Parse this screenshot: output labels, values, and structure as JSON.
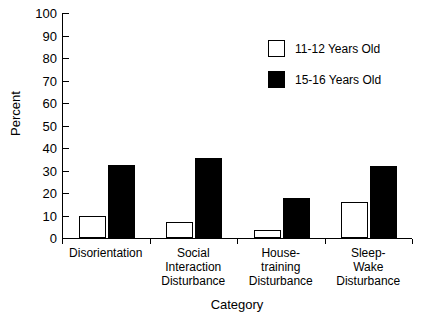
{
  "chart_data": {
    "type": "bar",
    "title": "",
    "xlabel": "Category",
    "ylabel": "Percent",
    "ylim": [
      0,
      100
    ],
    "yticks": [
      0,
      10,
      20,
      30,
      40,
      50,
      60,
      70,
      80,
      90,
      100
    ],
    "ytick_labels": [
      "0",
      "10",
      "20",
      "30",
      "40",
      "50",
      "60",
      "70",
      "80",
      "90",
      "100"
    ],
    "grid": false,
    "legend_position": "upper right",
    "categories": [
      "Disorientation",
      "Social\nInteraction\nDisturbance",
      "House-\ntraining\nDisturbance",
      "Sleep-\nWake\nDisturbance"
    ],
    "series": [
      {
        "name": "11-12 Years Old",
        "color": "#ffffff",
        "edge_color": "#000000",
        "values": [
          10,
          7,
          3.5,
          16
        ]
      },
      {
        "name": "15-16 Years Old",
        "color": "#000000",
        "edge_color": "#000000",
        "values": [
          32.5,
          35.5,
          18,
          32
        ]
      }
    ]
  },
  "legend": {
    "items": [
      {
        "label": "11-12 Years Old",
        "swatch": "light"
      },
      {
        "label": "15-16 Years Old",
        "swatch": "dark"
      }
    ]
  }
}
